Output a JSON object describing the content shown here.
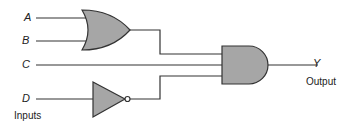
{
  "diagram": {
    "type": "logic-circuit",
    "inputs": [
      {
        "id": "A",
        "label": "A"
      },
      {
        "id": "B",
        "label": "B"
      },
      {
        "id": "C",
        "label": "C"
      },
      {
        "id": "D",
        "label": "D"
      }
    ],
    "gates": [
      {
        "id": "or1",
        "type": "OR",
        "inputs": [
          "A",
          "B"
        ]
      },
      {
        "id": "not1",
        "type": "NOT",
        "inputs": [
          "D"
        ]
      },
      {
        "id": "and1",
        "type": "AND",
        "inputs": [
          "or1",
          "C",
          "not1"
        ]
      }
    ],
    "output": {
      "id": "Y",
      "label": "Y",
      "caption": "Output"
    },
    "inputs_caption": "Inputs",
    "colors": {
      "gate_fill": "#a6a6a6",
      "wire": "#333333"
    }
  }
}
